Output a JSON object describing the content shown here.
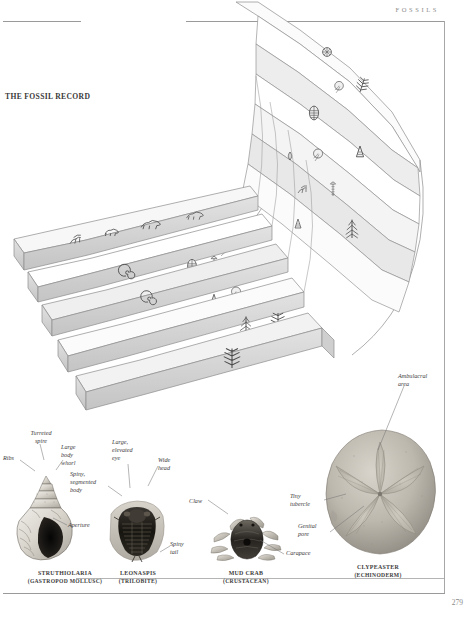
{
  "page": {
    "header_label": "FOSSILS",
    "figure_title": "THE FOSSIL RECORD",
    "page_number": "279",
    "background_color": "#ffffff",
    "rule_color": "#9a9a9a"
  },
  "strata_diagram": {
    "name": "the-fossil-record-strata",
    "description": "Curved stepped geological strata blocks in 3-D perspective with fossil organism illustrations on each layer",
    "band_light_color": "#ffffff",
    "band_shaded_color": "#e9e9e9",
    "block_side_color": "#d5d5d5",
    "outline_color": "#8d8d8d"
  },
  "specimens": [
    {
      "id": "struthiolaria",
      "name": "STRUTHIOLARIA",
      "group": "(GASTROPOD MOLLUSC)",
      "annotations": [
        {
          "id": "turreted-spire",
          "text": "Turreted\nspire"
        },
        {
          "id": "ribs",
          "text": "Ribs"
        },
        {
          "id": "large-body-whorl",
          "text": "Large\nbody\nwhorl"
        },
        {
          "id": "aperture",
          "text": "Aperture"
        }
      ]
    },
    {
      "id": "leonaspis",
      "name": "LEONASPIS",
      "group": "(TRILOBITE)",
      "annotations": [
        {
          "id": "spiny-segmented-body",
          "text": "Spiny,\nsegmented\nbody"
        },
        {
          "id": "large-elevated-eye",
          "text": "Large,\nelevated\neye"
        },
        {
          "id": "wide-head",
          "text": "Wide\nhead"
        },
        {
          "id": "spiny-tail",
          "text": "Spiny\ntail"
        }
      ]
    },
    {
      "id": "mud-crab",
      "name": "MUD CRAB",
      "group": "(CRUSTACEAN)",
      "annotations": [
        {
          "id": "claw",
          "text": "Claw"
        },
        {
          "id": "carapace",
          "text": "Carapace"
        }
      ]
    },
    {
      "id": "clypeaster",
      "name": "CLYPEASTER",
      "group": "(ECHINODERM)",
      "annotations": [
        {
          "id": "ambulacral-area",
          "text": "Ambulacral\narea"
        },
        {
          "id": "tiny-tubercle",
          "text": "Tiny\ntubercle"
        },
        {
          "id": "genital-pore",
          "text": "Genital\npore"
        }
      ]
    }
  ]
}
